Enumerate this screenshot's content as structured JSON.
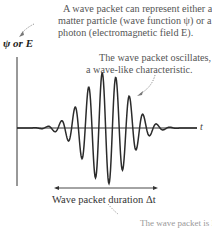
{
  "annotations": {
    "representation_line1": "A wave packet can represent either a",
    "representation_line2": "matter particle (wave function ψ) or a",
    "representation_line3": "photon (electromagnetic field E).",
    "oscillation_line1": "The wave packet oscillates,",
    "oscillation_line2": "a wave-like characteristic.",
    "bottom_cut": "The wave packet is localized"
  },
  "axes": {
    "y_label": "ψ or E",
    "x_label": "t"
  },
  "duration_label": "Wave packet duration Δt",
  "colors": {
    "curve": "#2b2b2b",
    "axis": "#333333",
    "text": "#444444",
    "annotation": "#666666"
  }
}
